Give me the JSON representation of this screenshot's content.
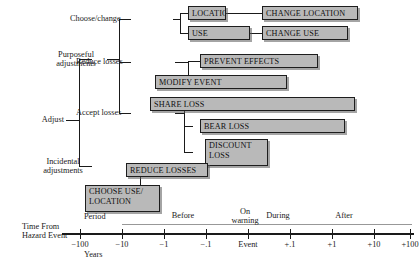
{
  "figure": {
    "type": "tree-timeline-diagram",
    "root_label": "Adjust"
  },
  "tree": {
    "root": "Adjust",
    "branches": [
      {
        "label": "Purposeful\nadjustments"
      },
      {
        "label": "Incidental\nadjustments"
      }
    ],
    "sub_branches": [
      {
        "label": "Choose/change"
      },
      {
        "label": "Reduce losses"
      },
      {
        "label": "Accept losses"
      }
    ]
  },
  "boxes": [
    {
      "id": "location",
      "label": "LOCATION"
    },
    {
      "id": "change-location",
      "label": "CHANGE LOCATION"
    },
    {
      "id": "use",
      "label": "USE"
    },
    {
      "id": "change-use",
      "label": "CHANGE USE"
    },
    {
      "id": "prevent-effects",
      "label": "PREVENT EFFECTS"
    },
    {
      "id": "modify-event",
      "label": "MODIFY EVENT"
    },
    {
      "id": "share-loss",
      "label": "SHARE LOSS"
    },
    {
      "id": "bear-loss",
      "label": "BEAR LOSS"
    },
    {
      "id": "discount-loss",
      "label": "DISCOUNT\nLOSS"
    },
    {
      "id": "reduce-losses",
      "label": "REDUCE LOSSES"
    },
    {
      "id": "choose-use-location",
      "label": "CHOOSE USE/\nLOCATION"
    }
  ],
  "axis": {
    "caption": "Time From\nHazard Event",
    "period_label": "Period",
    "units_label": "Years",
    "phases": [
      {
        "label": "Before"
      },
      {
        "label": "On\nwarning"
      },
      {
        "label": "During"
      },
      {
        "label": "After"
      }
    ],
    "ticks": [
      {
        "label": "−100"
      },
      {
        "label": "−10"
      },
      {
        "label": "−1"
      },
      {
        "label": "−.1"
      },
      {
        "label": "Event"
      },
      {
        "label": "+.1"
      },
      {
        "label": "+1"
      },
      {
        "label": "+10"
      },
      {
        "label": "+100"
      }
    ]
  },
  "colors": {
    "box_fill": "#b9b9b9",
    "box_stroke": "#1d1d1d",
    "line": "#1a1a1a",
    "background": "#ffffff"
  }
}
